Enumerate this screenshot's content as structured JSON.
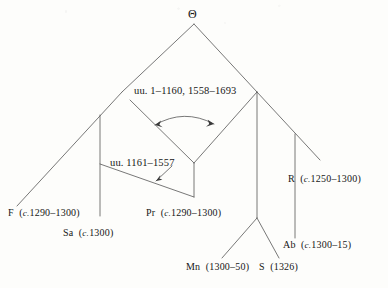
{
  "diagram": {
    "type": "stemma-codicum",
    "background_color": "#fdfdfb",
    "line_color": "#555555"
  },
  "root": {
    "id": "theta",
    "label": "Θ"
  },
  "internal_nodes": [
    {
      "id": "hyparchetype-upper",
      "label_prefix": "uu.",
      "label_ranges": "1–1160, 1558–1693",
      "full_label": "uu. 1–1160, 1558–1693"
    },
    {
      "id": "hyparchetype-lower",
      "label_prefix": "uu.",
      "label_ranges": "1161–1557",
      "full_label": "uu. 1161–1557"
    }
  ],
  "witnesses": [
    {
      "id": "F",
      "siglum": "F",
      "circa": "c.",
      "dates": "1290–1300",
      "has_circa": true
    },
    {
      "id": "Sa",
      "siglum": "Sa",
      "circa": "c.",
      "dates": "1300",
      "has_circa": true
    },
    {
      "id": "Pr",
      "siglum": "Pr",
      "circa": "c.",
      "dates": "1290–1300",
      "has_circa": true
    },
    {
      "id": "Mn",
      "siglum": "Mn",
      "circa": "",
      "dates": "1300–50",
      "has_circa": false
    },
    {
      "id": "S",
      "siglum": "S",
      "circa": "",
      "dates": "1326",
      "has_circa": false
    },
    {
      "id": "Ab",
      "siglum": "Ab",
      "circa": "c.",
      "dates": "1300–15",
      "has_circa": true
    },
    {
      "id": "R",
      "siglum": "R",
      "circa": "c.",
      "dates": "1250–1300",
      "has_circa": true
    }
  ],
  "annotations": [
    {
      "id": "contamination-arrow",
      "kind": "double-headed-curved-arrow",
      "note": "curved bidirectional arrow between the two descending branches below the upper hyparchetype"
    },
    {
      "id": "lower-hyparchetype-pointer",
      "kind": "single-headed-arrow",
      "note": "short arrow from the uu. 1161–1557 label to its node"
    }
  ]
}
